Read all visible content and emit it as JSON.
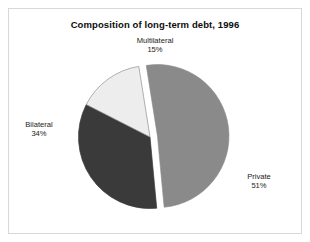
{
  "figure": {
    "title": "Composition of long-term debt, 1996",
    "background": "#ffffff",
    "frame_color": "#d8d8d8"
  },
  "chart_data": {
    "type": "pie",
    "title": "Composition of long-term debt, 1996",
    "xlabel": "",
    "ylabel": "",
    "categories": [
      "Multilateral",
      "Bilateral",
      "Private"
    ],
    "values": [
      15,
      34,
      51
    ],
    "value_unit": "percent",
    "legend": "none",
    "grid": false,
    "labels_inline": true,
    "slices": [
      {
        "name": "Multilateral",
        "label": "Multilateral",
        "value": 15,
        "value_label": "15%",
        "color": "#ededed",
        "edge_color": "#8f8f8f",
        "exploded": false,
        "start_angle_deg": 306,
        "end_angle_deg": 360
      },
      {
        "name": "Bilateral",
        "label": "Bilateral",
        "value": 34,
        "value_label": "34%",
        "color": "#3a3a3a",
        "edge_color": "#3a3a3a",
        "exploded": false,
        "start_angle_deg": 183.6,
        "end_angle_deg": 306
      },
      {
        "name": "Private",
        "label": "Private",
        "value": 51,
        "value_label": "51%",
        "color": "#8a8a8a",
        "edge_color": "#8a8a8a",
        "exploded": true,
        "start_angle_deg": 0,
        "end_angle_deg": 183.6
      }
    ]
  }
}
